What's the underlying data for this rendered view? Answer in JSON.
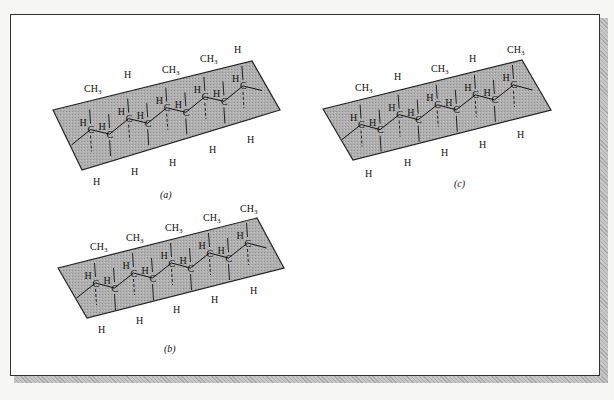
{
  "figure": {
    "panels": [
      {
        "id": "a",
        "caption": "(a)",
        "plane": {
          "left": [
            53,
            110
          ],
          "top_right": [
            252,
            61
          ],
          "bottom_right": [
            280,
            110
          ],
          "bottom_left": [
            82,
            170
          ]
        },
        "backbone": [
          [
            56,
            135
          ],
          [
            70,
            128
          ],
          [
            84,
            122
          ],
          [
            98,
            116
          ],
          [
            112,
            108
          ],
          [
            126,
            101
          ],
          [
            140,
            96
          ],
          [
            154,
            91
          ],
          [
            168,
            85
          ],
          [
            180,
            78
          ],
          [
            194,
            72
          ],
          [
            206,
            66
          ]
        ],
        "above_labels": [
          {
            "text": "CH",
            "sub": "3",
            "x": 84,
            "y": 92
          },
          {
            "text": "H",
            "x": 124,
            "y": 78
          },
          {
            "text": "CH",
            "sub": "3",
            "x": 162,
            "y": 73
          },
          {
            "text": "CH",
            "sub": "3",
            "x": 200,
            "y": 62
          },
          {
            "text": "H",
            "x": 234,
            "y": 53
          }
        ],
        "below_labels": [
          {
            "text": "H",
            "x": 93,
            "y": 185
          },
          {
            "text": "H",
            "x": 131,
            "y": 175
          },
          {
            "text": "H",
            "x": 169,
            "y": 166
          },
          {
            "text": "H",
            "x": 209,
            "y": 153
          },
          {
            "text": "H",
            "x": 247,
            "y": 143
          }
        ]
      },
      {
        "id": "b",
        "caption": "(b)",
        "plane": {
          "left": [
            58,
            268
          ],
          "top_right": [
            257,
            218
          ],
          "bottom_right": [
            284,
            268
          ],
          "bottom_left": [
            87,
            318
          ]
        },
        "above_labels": [
          {
            "text": "CH",
            "sub": "3",
            "x": 90,
            "y": 250
          },
          {
            "text": "CH",
            "sub": "3",
            "x": 126,
            "y": 241
          },
          {
            "text": "CH",
            "sub": "3",
            "x": 165,
            "y": 231
          },
          {
            "text": "CH",
            "sub": "3",
            "x": 203,
            "y": 221
          },
          {
            "text": "CH",
            "sub": "3",
            "x": 240,
            "y": 212
          }
        ],
        "below_labels": [
          {
            "text": "H",
            "x": 98,
            "y": 333
          },
          {
            "text": "H",
            "x": 136,
            "y": 324
          },
          {
            "text": "H",
            "x": 173,
            "y": 313
          },
          {
            "text": "H",
            "x": 211,
            "y": 303
          },
          {
            "text": "H",
            "x": 250,
            "y": 294
          }
        ]
      },
      {
        "id": "c",
        "caption": "(c)",
        "plane": {
          "left": [
            323,
            109
          ],
          "top_right": [
            522,
            60
          ],
          "bottom_right": [
            551,
            110
          ],
          "bottom_left": [
            353,
            160
          ]
        },
        "above_labels": [
          {
            "text": "CH",
            "sub": "3",
            "x": 355,
            "y": 91
          },
          {
            "text": "H",
            "x": 394,
            "y": 80
          },
          {
            "text": "CH",
            "sub": "3",
            "x": 431,
            "y": 72
          },
          {
            "text": "H",
            "x": 469,
            "y": 62
          },
          {
            "text": "CH",
            "sub": "3",
            "x": 507,
            "y": 53
          }
        ],
        "below_labels": [
          {
            "text": "H",
            "x": 365,
            "y": 177
          },
          {
            "text": "H",
            "x": 404,
            "y": 166
          },
          {
            "text": "H",
            "x": 441,
            "y": 156
          },
          {
            "text": "H",
            "x": 479,
            "y": 148
          },
          {
            "text": "H",
            "x": 517,
            "y": 138
          }
        ]
      }
    ],
    "atom_label": "C",
    "colors": {
      "plane_fill": "#a8a8a8",
      "plane_stroke": "#222222",
      "bond": "#111111",
      "frame_border": "#333333",
      "shadow": "#b5b5b5"
    }
  }
}
